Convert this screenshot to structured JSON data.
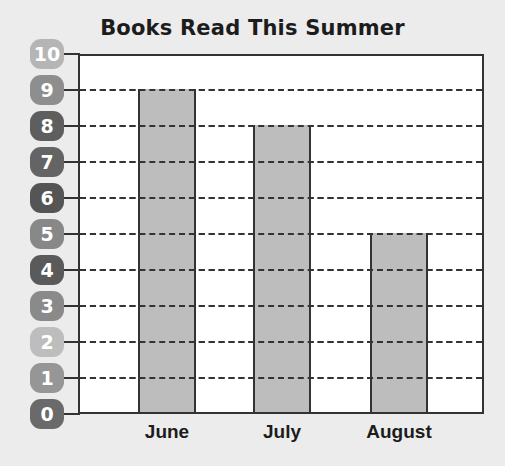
{
  "chart_data": {
    "type": "bar",
    "title": "Books Read This Summer",
    "categories": [
      "June",
      "July",
      "August"
    ],
    "values": [
      9,
      8,
      5
    ],
    "xlabel": "",
    "ylabel": "",
    "ylim": [
      0,
      10
    ],
    "yticks": [
      0,
      1,
      2,
      3,
      4,
      5,
      6,
      7,
      8,
      9,
      10
    ],
    "grid": "dashed horizontal lines at each integer",
    "legend": null
  },
  "colors": {
    "background": "#ececec",
    "plot_background": "#ffffff",
    "bar_fill": "#bdbdbd",
    "axis_line": "#333333",
    "badge_shades": {
      "10": "#b5b5b5",
      "9": "#8e8e8e",
      "8": "#5e5e5e",
      "7": "#646464",
      "6": "#555555",
      "5": "#888888",
      "4": "#5a5a5a",
      "3": "#8a8a8a",
      "2": "#bdbdbd",
      "1": "#969696",
      "0": "#6a6a6a"
    }
  }
}
